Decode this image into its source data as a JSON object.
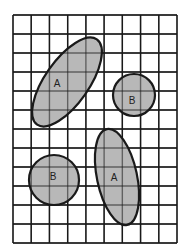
{
  "diagram": {
    "grid": {
      "columns": 9,
      "rows": 12
    },
    "colors": {
      "background": "#ffffff",
      "grid_line": "#1a1a1a",
      "shape_fill": "#b8b8b8",
      "shape_stroke": "#1a1a1a",
      "label": "#222222"
    },
    "shapes": [
      {
        "id": "shape-a-upper",
        "type": "ellipse",
        "label": "A"
      },
      {
        "id": "shape-b-upper",
        "type": "circle",
        "label": "B"
      },
      {
        "id": "shape-b-lower",
        "type": "circle",
        "label": "B"
      },
      {
        "id": "shape-a-lower",
        "type": "ellipse",
        "label": "A"
      }
    ]
  }
}
